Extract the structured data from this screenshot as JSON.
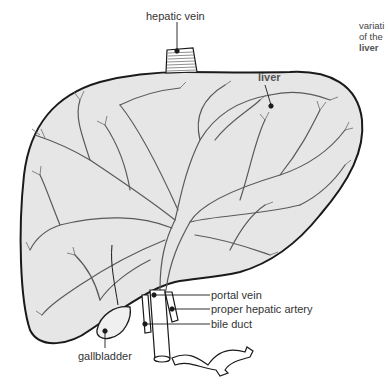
{
  "diagram": {
    "subject": "liver",
    "side_caption": {
      "lines": [
        "variati",
        "of the"
      ],
      "emphasis": "liver"
    },
    "labels": {
      "hepatic_vein": "hepatic vein",
      "liver": "liver",
      "portal_vein": "portal vein",
      "proper_hepatic_artery": "proper hepatic artery",
      "bile_duct": "bile duct",
      "gallbladder": "gallbladder"
    },
    "colors": {
      "organ_fill": "#e6e6e6",
      "outline": "#1a1a1a",
      "vessel_line": "#555555",
      "text": "#333333"
    }
  }
}
